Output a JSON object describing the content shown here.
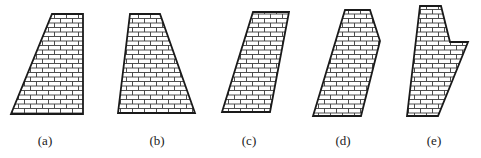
{
  "figure": {
    "fill_pattern": "brick",
    "stroke_color": "#1a1a1a",
    "brick_line_color": "#3a3a3a",
    "background": "#ffffff"
  },
  "shapes": [
    {
      "id": "a",
      "label": "(a)",
      "label_pos": [
        45,
        144
      ],
      "points": [
        [
          52,
          14
        ],
        [
          83,
          14
        ],
        [
          83,
          114
        ],
        [
          11,
          114
        ]
      ]
    },
    {
      "id": "b",
      "label": "(b)",
      "label_pos": [
        157,
        144
      ],
      "points": [
        [
          130,
          14
        ],
        [
          160,
          14
        ],
        [
          195,
          113
        ],
        [
          118,
          113
        ]
      ]
    },
    {
      "id": "c",
      "label": "(c)",
      "label_pos": [
        249,
        144
      ],
      "points": [
        [
          253,
          12
        ],
        [
          289,
          12
        ],
        [
          270,
          112
        ],
        [
          222,
          112
        ]
      ]
    },
    {
      "id": "d",
      "label": "(d)",
      "label_pos": [
        343,
        144
      ],
      "points": [
        [
          345,
          10
        ],
        [
          370,
          10
        ],
        [
          380,
          41
        ],
        [
          361,
          116
        ],
        [
          313,
          116
        ]
      ]
    },
    {
      "id": "e",
      "label": "(e)",
      "label_pos": [
        434,
        144
      ],
      "points": [
        [
          420,
          6
        ],
        [
          441,
          6
        ],
        [
          450,
          42
        ],
        [
          468,
          42
        ],
        [
          438,
          116
        ],
        [
          407,
          116
        ]
      ]
    }
  ]
}
